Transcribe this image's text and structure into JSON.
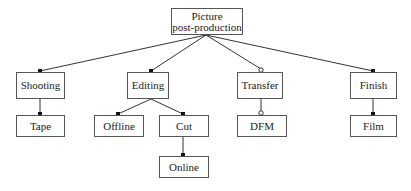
{
  "diagram": {
    "type": "tree",
    "root": {
      "id": "picture-post-production",
      "label_line1": "Picture",
      "label_line2": "post-production"
    },
    "nodes": {
      "shooting": {
        "label": "Shooting"
      },
      "tape": {
        "label": "Tape"
      },
      "editing": {
        "label": "Editing"
      },
      "offline": {
        "label": "Offline"
      },
      "cut": {
        "label": "Cut"
      },
      "online": {
        "label": "Online"
      },
      "transfer": {
        "label": "Transfer"
      },
      "dfm": {
        "label": "DFM"
      },
      "finish": {
        "label": "Finish"
      },
      "film": {
        "label": "Film"
      }
    },
    "edges": [
      {
        "from": "Picture post-production",
        "to": "Shooting",
        "end_marker": "filled-dot"
      },
      {
        "from": "Picture post-production",
        "to": "Editing",
        "end_marker": "filled-dot"
      },
      {
        "from": "Picture post-production",
        "to": "Transfer",
        "end_marker": "hollow-circle"
      },
      {
        "from": "Picture post-production",
        "to": "Finish",
        "end_marker": "filled-dot"
      },
      {
        "from": "Shooting",
        "to": "Tape",
        "end_marker": "filled-dot"
      },
      {
        "from": "Editing",
        "to": "Offline",
        "end_marker": "filled-dot"
      },
      {
        "from": "Editing",
        "to": "Cut",
        "end_marker": "filled-dot"
      },
      {
        "from": "Cut",
        "to": "Online",
        "end_marker": "filled-dot"
      },
      {
        "from": "Transfer",
        "to": "DFM",
        "end_marker": "hollow-circle"
      },
      {
        "from": "Finish",
        "to": "Film",
        "end_marker": "filled-dot"
      }
    ],
    "colors": {
      "line": "#333333",
      "box_border": "#555555",
      "text": "#222222",
      "background": "#ffffff"
    }
  }
}
